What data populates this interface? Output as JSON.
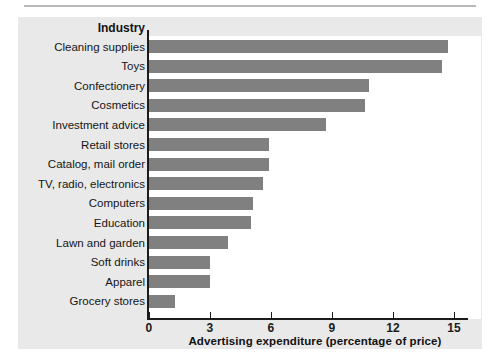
{
  "figure": {
    "panel_background": "#e9e9e9",
    "plot_background": "#ffffff",
    "bar_color": "#808080",
    "axis_color": "#1b1b1b"
  },
  "axes": {
    "y_header": "Industry",
    "x_title": "Advertising expenditure (percentage of price)",
    "x_ticks": [
      "0",
      "3",
      "6",
      "9",
      "12",
      "15"
    ]
  },
  "chart_data": {
    "type": "bar",
    "orientation": "horizontal",
    "title": "",
    "subtitle": "",
    "xlabel": "Advertising expenditure (percentage of price)",
    "ylabel": "Industry",
    "xlim": [
      0,
      16.2
    ],
    "xticks": [
      0,
      3,
      6,
      9,
      12,
      15
    ],
    "grid": false,
    "legend": null,
    "categories": [
      "Cleaning supplies",
      "Toys",
      "Confectionery",
      "Cosmetics",
      "Investment advice",
      "Retail stores",
      "Catalog, mail order",
      "TV, radio, electronics",
      "Computers",
      "Education",
      "Lawn and garden",
      "Soft drinks",
      "Apparel",
      "Grocery stores"
    ],
    "values": [
      14.7,
      14.4,
      10.8,
      10.6,
      8.7,
      5.9,
      5.9,
      5.6,
      5.1,
      5.0,
      3.9,
      3.0,
      3.0,
      1.3
    ]
  }
}
